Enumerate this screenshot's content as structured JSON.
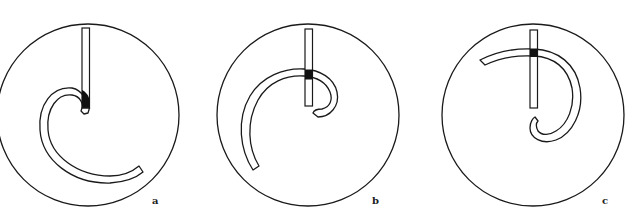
{
  "figure": {
    "panels": [
      {
        "id": "a",
        "label": "a"
      },
      {
        "id": "b",
        "label": "b"
      },
      {
        "id": "c",
        "label": "c"
      }
    ]
  },
  "colors": {
    "line": "#1a1a1a",
    "fill": "#ffffff",
    "junction": "#111111"
  }
}
